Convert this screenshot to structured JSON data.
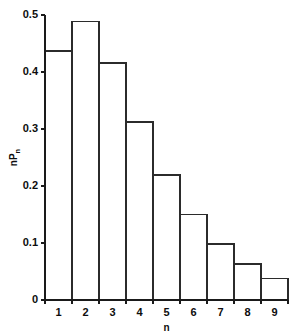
{
  "chart_data": {
    "type": "bar",
    "title": "",
    "subtitle": "",
    "xlabel": "n",
    "ylabel": "nPn",
    "ylabel_parts": {
      "base1": "n",
      "base2": "P",
      "sub": "n"
    },
    "categories": [
      "1",
      "2",
      "3",
      "4",
      "5",
      "6",
      "7",
      "8",
      "9"
    ],
    "values": [
      0.437,
      0.489,
      0.416,
      0.312,
      0.219,
      0.15,
      0.098,
      0.063,
      0.038
    ],
    "xlim": [
      0.5,
      9.5
    ],
    "ylim": [
      0,
      0.5
    ],
    "ytick_labels": [
      "0",
      "0.1",
      "0.2",
      "0.3",
      "0.4",
      "0.5"
    ],
    "ytick_values": [
      0,
      0.1,
      0.2,
      0.3,
      0.4,
      0.5
    ],
    "xtick_labels": [
      "1",
      "2",
      "3",
      "4",
      "5",
      "6",
      "7",
      "8",
      "9"
    ],
    "grid": false,
    "legend": false,
    "legend_position": "none",
    "bar_fill_color": "#ffffff",
    "bar_edge_color": "#2b2b2b",
    "axis_color": "#1a1a1a",
    "background_color": "#ffffff",
    "annotations": []
  },
  "geometry": {
    "plot_left": 45,
    "plot_right": 288,
    "plot_top": 15,
    "plot_bottom": 300
  }
}
